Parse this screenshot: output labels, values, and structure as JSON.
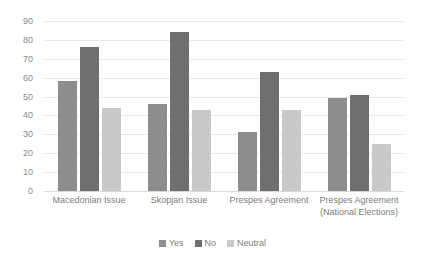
{
  "chart_data": {
    "type": "bar",
    "title": "",
    "subtitle": "",
    "xlabel": "",
    "ylabel": "",
    "ylim": [
      0,
      90
    ],
    "ytick_step": 10,
    "grid": true,
    "legend_position": "bottom",
    "categories": [
      "Macedonian Issue",
      "Skopjan Issue",
      "Prespes Agreement",
      "Prespes Agreement (National Elections)"
    ],
    "category_lines": [
      [
        "Macedonian Issue"
      ],
      [
        "Skopjan Issue"
      ],
      [
        "Prespes Agreement"
      ],
      [
        "Prespes Agreement",
        "(National Elections)"
      ]
    ],
    "ytick_labels": [
      "90",
      "80",
      "70",
      "60",
      "50",
      "40",
      "30",
      "20",
      "10",
      "0"
    ],
    "ytick_values": [
      90,
      80,
      70,
      60,
      50,
      40,
      30,
      20,
      10,
      0
    ],
    "series": [
      {
        "name": "Yes",
        "color": "#8d8d8d",
        "values": [
          58,
          46,
          31,
          49
        ]
      },
      {
        "name": "No",
        "color": "#6f6f6f",
        "values": [
          76,
          84,
          63,
          51
        ]
      },
      {
        "name": "Neutral",
        "color": "#c9c9c9",
        "values": [
          44,
          43,
          43,
          25
        ]
      }
    ]
  },
  "legend": {
    "items": [
      {
        "label": "Yes",
        "color": "#8d8d8d"
      },
      {
        "label": "No",
        "color": "#6f6f6f"
      },
      {
        "label": "Neutral",
        "color": "#c9c9c9"
      }
    ]
  },
  "colors": {
    "background": "#ffffff",
    "gridline": "#e8e8e8",
    "baseline": "#d9d9d9",
    "tick_text": "#8a8a8a",
    "label_text": "#7d7d7d"
  }
}
